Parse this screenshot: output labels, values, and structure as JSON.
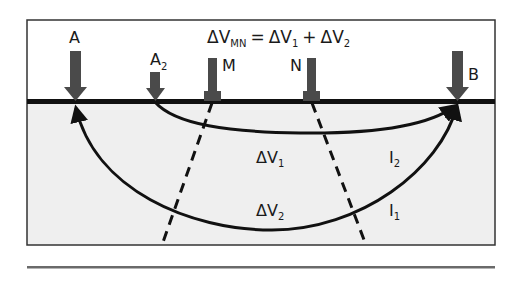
{
  "diagram": {
    "type": "resistivity-survey-electrode-diagram",
    "equation": {
      "lhs": "ΔV",
      "lhs_sub": "MN",
      "eq": "=",
      "term1": "ΔV",
      "term1_sub": "1",
      "plus": "+",
      "term2": "ΔV",
      "term2_sub": "2"
    },
    "electrodes": [
      {
        "id": "A",
        "label": "A",
        "sub": "",
        "kind": "current-arrow"
      },
      {
        "id": "A2",
        "label": "A",
        "sub": "2",
        "kind": "current-arrow"
      },
      {
        "id": "M",
        "label": "M",
        "sub": "",
        "kind": "potential-electrode"
      },
      {
        "id": "N",
        "label": "N",
        "sub": "",
        "kind": "potential-electrode"
      },
      {
        "id": "B",
        "label": "B",
        "sub": "",
        "kind": "current-arrow"
      }
    ],
    "region_labels": [
      {
        "id": "dv1",
        "label": "ΔV",
        "sub": "1"
      },
      {
        "id": "dv2",
        "label": "ΔV",
        "sub": "2"
      },
      {
        "id": "i2",
        "label": "I",
        "sub": "2"
      },
      {
        "id": "i1",
        "label": "I",
        "sub": "1"
      }
    ],
    "colors": {
      "ground": "#efefef",
      "sky": "#ffffff",
      "line": "#111111",
      "arrow": "#4a4a4a",
      "frame": "#333333",
      "separator": "#6a6a6a"
    }
  }
}
